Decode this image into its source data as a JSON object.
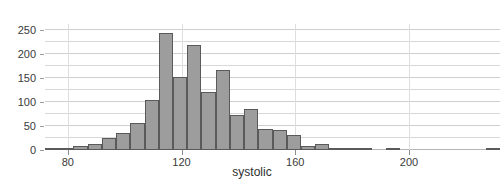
{
  "chart_data": {
    "type": "bar",
    "title": "",
    "subtitle": "",
    "xlabel": "systolic",
    "ylabel": "count",
    "xlim": [
      72,
      232
    ],
    "ylim": [
      0,
      262
    ],
    "grid": true,
    "legend": null,
    "bin_width": 5,
    "x_ticks": [
      80,
      120,
      160,
      200
    ],
    "x_tick_labels": [
      "80",
      "120",
      "160",
      "200"
    ],
    "y_ticks": [
      0,
      50,
      100,
      150,
      200,
      250
    ],
    "y_tick_labels": [
      "0",
      "50",
      "100",
      "150",
      "200",
      "250"
    ],
    "y_minor_ticks": [
      25,
      75,
      125,
      175,
      225
    ],
    "bin_starts": [
      72,
      77,
      82,
      87,
      92,
      97,
      102,
      107,
      112,
      117,
      122,
      127,
      132,
      137,
      142,
      147,
      152,
      157,
      162,
      167,
      172,
      177,
      182,
      187,
      192,
      197,
      202,
      207,
      212,
      217,
      222,
      227
    ],
    "categories": [
      "72-77",
      "77-82",
      "82-87",
      "87-92",
      "92-97",
      "97-102",
      "102-107",
      "107-112",
      "112-117",
      "117-122",
      "122-127",
      "127-132",
      "132-137",
      "137-142",
      "142-147",
      "147-152",
      "152-157",
      "157-162",
      "162-167",
      "167-172",
      "172-177",
      "177-182",
      "182-187",
      "187-192",
      "192-197",
      "197-202",
      "202-207",
      "207-212",
      "212-217",
      "217-222",
      "222-227",
      "227-232"
    ],
    "values": [
      2,
      4,
      9,
      13,
      25,
      36,
      57,
      103,
      243,
      152,
      218,
      120,
      166,
      72,
      85,
      44,
      41,
      31,
      9,
      13,
      5,
      5,
      2,
      0,
      4,
      0,
      0,
      0,
      0,
      0,
      0,
      4
    ],
    "bar_color": "#9d9d9d",
    "bar_edge_color": "#5a5a5a",
    "grid_color": "#d8d8d8",
    "axis_text_color": "#3a3a3a"
  }
}
